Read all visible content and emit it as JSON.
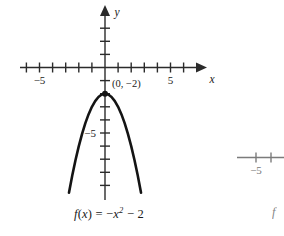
{
  "figure": {
    "background_color": "#ffffff",
    "ink_color": "#1a1a1a",
    "curve_color": "#141414"
  },
  "main_graph": {
    "name": "parabola-graph",
    "x_axis": {
      "label": "x",
      "tick_label_negative": "−5",
      "tick_label_positive": "5",
      "ticks": [
        -6,
        -5,
        -4,
        -3,
        -2,
        -1,
        1,
        2,
        3,
        4,
        5,
        6
      ],
      "labeled_ticks": [
        -5,
        5
      ],
      "range": [
        -6.8,
        6.8
      ],
      "arrow": "right"
    },
    "y_axis": {
      "label": "y",
      "tick_label_negative": "−5",
      "ticks": [
        -9,
        -8,
        -7,
        -6,
        -5,
        -4,
        -3,
        -2,
        -1,
        1,
        2,
        3
      ],
      "labeled_ticks": [
        -5
      ],
      "range": [
        -9.6,
        3.4
      ],
      "arrow": "up"
    },
    "vertex": {
      "label": "(0, −2)",
      "x": 0,
      "y": -2,
      "marker": "dot"
    },
    "equation": {
      "f_name": "f",
      "argument": "(x)",
      "equals": "=",
      "rhs_lead": "−x",
      "exponent": "2",
      "rhs_tail": "− 2",
      "full_text": "f(x) = −x² − 2"
    }
  },
  "secondary_graph": {
    "name": "partial-graph-cropped",
    "x_axis": {
      "tick_label_negative": "−5",
      "ticks": [
        -5,
        -4
      ],
      "labeled_ticks": [
        -5
      ]
    },
    "equation": {
      "f_name": "f"
    }
  },
  "chart_data": {
    "type": "line",
    "title": "",
    "xlabel": "x",
    "ylabel": "y",
    "xlim": [
      -6.8,
      6.8
    ],
    "ylim": [
      -9.6,
      3.4
    ],
    "grid": false,
    "legend": "none",
    "annotations": [
      {
        "text": "(0, −2)",
        "x": 0,
        "y": -2
      },
      {
        "text": "f(x) = −x² − 2",
        "x": 0,
        "y": -11.5
      }
    ],
    "xticks": [
      -6,
      -5,
      -4,
      -3,
      -2,
      -1,
      1,
      2,
      3,
      4,
      5,
      6
    ],
    "xticklabels": [
      "",
      "−5",
      "",
      "",
      "",
      "",
      "",
      "",
      "",
      "",
      "5",
      ""
    ],
    "yticks": [
      -9,
      -8,
      -7,
      -6,
      -5,
      -4,
      -3,
      -2,
      -1,
      1,
      2,
      3
    ],
    "yticklabels": [
      "",
      "",
      "",
      "",
      "−5",
      "",
      "",
      "",
      "",
      "",
      "",
      ""
    ],
    "series": [
      {
        "name": "f(x) = -x^2 - 2",
        "equation": "y = -x^2 - 2",
        "x": [
          -2.75,
          -2.5,
          -2.25,
          -2.0,
          -1.75,
          -1.5,
          -1.25,
          -1.0,
          -0.75,
          -0.5,
          -0.25,
          0,
          0.25,
          0.5,
          0.75,
          1.0,
          1.25,
          1.5,
          1.75,
          2.0,
          2.25,
          2.5,
          2.75
        ],
        "values": [
          -9.5625,
          -8.25,
          -7.0625,
          -6.0,
          -5.0625,
          -4.25,
          -3.5625,
          -3.0,
          -2.5625,
          -2.25,
          -2.0625,
          -2.0,
          -2.0625,
          -2.25,
          -2.5625,
          -3.0,
          -3.5625,
          -4.25,
          -5.0625,
          -6.0,
          -7.0625,
          -8.25,
          -9.5625
        ]
      }
    ]
  }
}
